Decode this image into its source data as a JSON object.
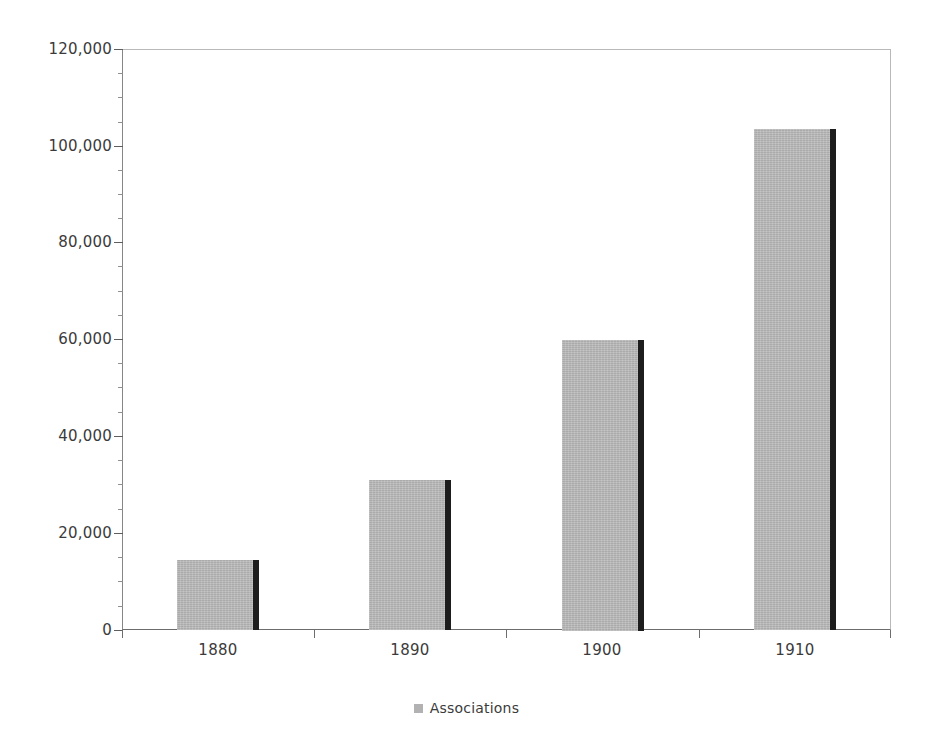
{
  "chart_data": {
    "type": "bar",
    "title": "",
    "subtitle": "",
    "xlabel": "",
    "ylabel": "",
    "categories": [
      "1880",
      "1890",
      "1900",
      "1910"
    ],
    "series": [
      {
        "name": "Associations",
        "values": [
          14500,
          31000,
          60000,
          103500
        ],
        "color": "#b9b9b9"
      }
    ],
    "ylim": [
      0,
      120000
    ],
    "yticks": [
      0,
      20000,
      40000,
      60000,
      80000,
      100000,
      120000
    ],
    "ytick_labels": [
      "0",
      "20,000",
      "40,000",
      "60,000",
      "80,000",
      "100,000",
      "120,000"
    ],
    "y_minor_tick_interval": 5000,
    "grid": {
      "horizontal": true,
      "vertical": false,
      "color": "#a6a6a6"
    },
    "legend": {
      "position": "bottom",
      "entries": [
        {
          "label": "Associations",
          "swatch_color": "#b2b2b2"
        }
      ]
    },
    "plot_background": "#ffffff",
    "bar_shadow_color": "#1d1d1d"
  },
  "legend": {
    "entry_label": "Associations"
  }
}
